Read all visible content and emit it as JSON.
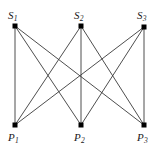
{
  "figure": {
    "caption": "",
    "background_color": "#ffffff",
    "edge_color": "#3a3a3a",
    "node_color": "#000000",
    "label_color": "#1a1a1a",
    "width": 161,
    "height": 154
  },
  "chart_data": {
    "type": "diagram",
    "graph_type": "complete bipartite graph K(3,3)",
    "title": "",
    "xlabel": "",
    "ylabel": "",
    "directed": false,
    "node_marker": "filled-square",
    "node_size_px": 5,
    "edge_width_px": 0.9,
    "top_set_name": "S",
    "bottom_set_name": "P",
    "nodes": [
      {
        "id": "S1",
        "base": "S",
        "sub": "1",
        "x": 15,
        "y": 26,
        "label_x": 8,
        "label_y": 10,
        "row": "top"
      },
      {
        "id": "S2",
        "base": "S",
        "sub": "2",
        "x": 81,
        "y": 26,
        "label_x": 74,
        "label_y": 10,
        "row": "top"
      },
      {
        "id": "S3",
        "base": "S",
        "sub": "3",
        "x": 144,
        "y": 27,
        "label_x": 137,
        "label_y": 10,
        "row": "top"
      },
      {
        "id": "P1",
        "base": "P",
        "sub": "1",
        "x": 15,
        "y": 125,
        "label_x": 8,
        "label_y": 132,
        "row": "bottom"
      },
      {
        "id": "P2",
        "base": "P",
        "sub": "2",
        "x": 81,
        "y": 125,
        "label_x": 74,
        "label_y": 132,
        "row": "bottom"
      },
      {
        "id": "P3",
        "base": "P",
        "sub": "3",
        "x": 144,
        "y": 125,
        "label_x": 137,
        "label_y": 132,
        "row": "bottom"
      }
    ],
    "edges": [
      {
        "from": "S1",
        "to": "P1"
      },
      {
        "from": "S1",
        "to": "P2"
      },
      {
        "from": "S1",
        "to": "P3"
      },
      {
        "from": "S2",
        "to": "P1"
      },
      {
        "from": "S2",
        "to": "P2"
      },
      {
        "from": "S2",
        "to": "P3"
      },
      {
        "from": "S3",
        "to": "P1"
      },
      {
        "from": "S3",
        "to": "P2"
      },
      {
        "from": "S3",
        "to": "P3"
      }
    ]
  }
}
